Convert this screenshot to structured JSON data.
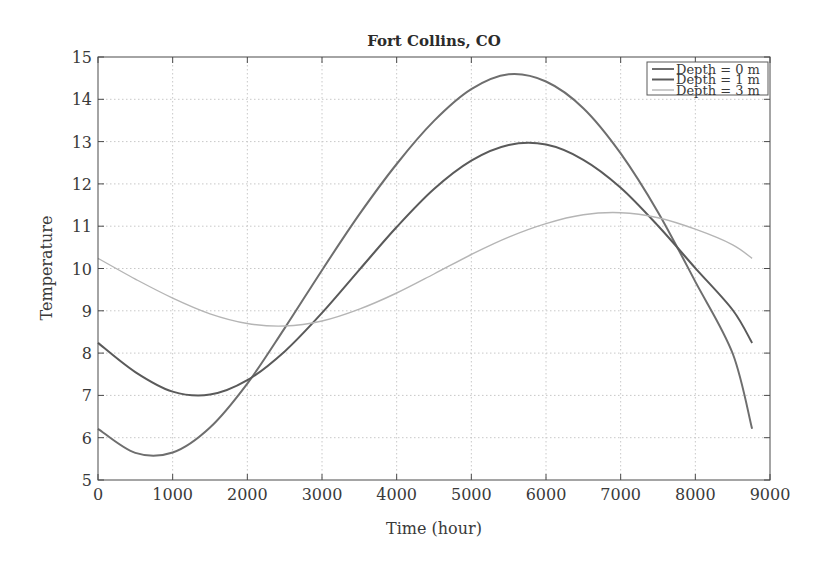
{
  "chart_data": {
    "type": "line",
    "title": "Fort Collins, CO",
    "xlabel": "Time (hour)",
    "ylabel": "Temperature",
    "xlim": [
      0,
      9000
    ],
    "ylim": [
      5,
      15
    ],
    "xticks": [
      0,
      1000,
      2000,
      3000,
      4000,
      5000,
      6000,
      7000,
      8000,
      9000
    ],
    "yticks": [
      5,
      6,
      7,
      8,
      9,
      10,
      11,
      12,
      13,
      14,
      15
    ],
    "grid": true,
    "legend_position": "upper right",
    "x": [
      0,
      500,
      1000,
      1500,
      2000,
      2500,
      3000,
      3500,
      4000,
      4500,
      5000,
      5500,
      6000,
      6500,
      7000,
      7500,
      8000,
      8500,
      8760
    ],
    "series": [
      {
        "name": "Depth = 0 m",
        "color": "#6e6e6e",
        "width": 2.0,
        "values": [
          6.21,
          5.64,
          5.65,
          6.24,
          7.28,
          8.59,
          9.96,
          11.28,
          12.47,
          13.49,
          14.24,
          14.59,
          14.42,
          13.79,
          12.72,
          11.33,
          9.69,
          7.99,
          6.21
        ]
      },
      {
        "name": "Depth = 1 m",
        "color": "#5a5a5a",
        "width": 2.0,
        "values": [
          8.24,
          7.55,
          7.09,
          7.02,
          7.36,
          8.04,
          8.95,
          9.97,
          10.98,
          11.88,
          12.55,
          12.92,
          12.93,
          12.57,
          11.91,
          11.01,
          10.01,
          9.02,
          8.24
        ]
      },
      {
        "name": "Depth = 3 m",
        "color": "#b5b5b5",
        "width": 1.4,
        "values": [
          10.24,
          9.75,
          9.3,
          8.93,
          8.7,
          8.64,
          8.76,
          9.04,
          9.42,
          9.87,
          10.33,
          10.74,
          11.06,
          11.27,
          11.32,
          11.2,
          10.93,
          10.56,
          10.24
        ]
      }
    ]
  },
  "labels": {
    "title": "Fort Collins, CO",
    "xlabel": "Time (hour)",
    "ylabel": "Temperature"
  }
}
